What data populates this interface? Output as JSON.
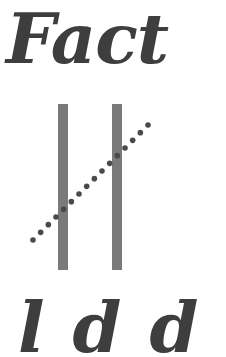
{
  "title": "Fact",
  "bottom_text": "ldd",
  "colors": {
    "ink": "#3e3e3e",
    "bar": "#7a7a7a",
    "dot": "#4a4a4a",
    "background": "#ffffff"
  },
  "figure": {
    "bars": [
      {
        "x": 58,
        "y": 104,
        "width": 10,
        "height": 166
      },
      {
        "x": 112,
        "y": 104,
        "width": 10,
        "height": 166
      }
    ],
    "dots": {
      "count": 16,
      "start": [
        33,
        240
      ],
      "end": [
        148,
        125
      ],
      "radius": 2.8
    }
  }
}
